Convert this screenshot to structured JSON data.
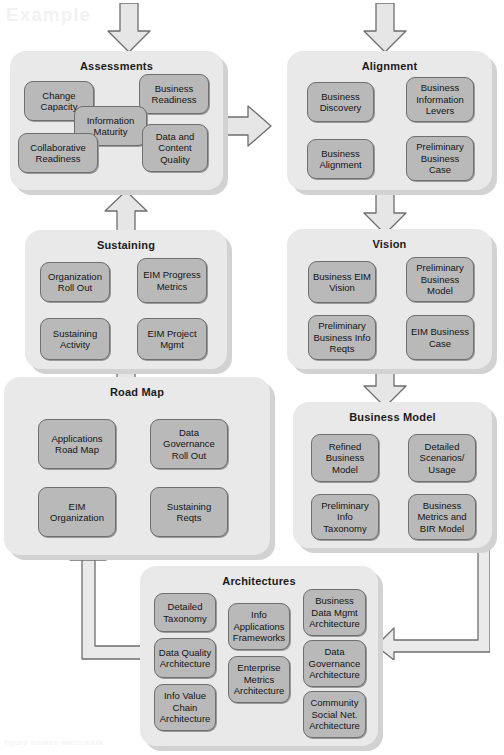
{
  "diagram": {
    "watermark_top": "Example",
    "watermark_bottom": "figure source watermark",
    "colors": {
      "panel_fill": "#e9e9e9",
      "panel_shadow": "#d2d2d2",
      "box_fill": "#b9b9b9",
      "box_border": "#6f6f6f",
      "arrow_fill": "#e4e4e4",
      "arrow_stroke": "#6e6e6e",
      "text": "#141414",
      "page_background": "#ffffff"
    }
  },
  "panels": [
    {
      "id": "assessments",
      "title": "Assessments",
      "boxes": [
        {
          "label": "Change Capacity"
        },
        {
          "label": "Business Readiness"
        },
        {
          "label": "Information Maturity"
        },
        {
          "label": "Collaborative Readiness"
        },
        {
          "label": "Data and Content Quality"
        }
      ]
    },
    {
      "id": "alignment",
      "title": "Alignment",
      "boxes": [
        {
          "label": "Business Discovery"
        },
        {
          "label": "Business Information Levers"
        },
        {
          "label": "Business Alignment"
        },
        {
          "label": "Preliminary Business Case"
        }
      ]
    },
    {
      "id": "sustaining",
      "title": "Sustaining",
      "boxes": [
        {
          "label": "Organization Roll Out"
        },
        {
          "label": "EIM Progress Metrics"
        },
        {
          "label": "Sustaining Activity"
        },
        {
          "label": "EIM Project Mgmt"
        }
      ]
    },
    {
      "id": "vision",
      "title": "Vision",
      "boxes": [
        {
          "label": "Business EIM Vision"
        },
        {
          "label": "Preliminary Business Model"
        },
        {
          "label": "Preliminary Business Info Reqts"
        },
        {
          "label": "EIM Business Case"
        }
      ]
    },
    {
      "id": "roadmap",
      "title": "Road Map",
      "boxes": [
        {
          "label": "Applications Road Map"
        },
        {
          "label": "Data Governance Roll Out"
        },
        {
          "label": "EIM Organization"
        },
        {
          "label": "Sustaining Reqts"
        }
      ]
    },
    {
      "id": "businessmodel",
      "title": "Business Model",
      "boxes": [
        {
          "label": "Refined Business Model"
        },
        {
          "label": "Detailed Scenarios/ Usage"
        },
        {
          "label": "Preliminary Info Taxonomy"
        },
        {
          "label": "Business Metrics and BIR Model"
        }
      ]
    },
    {
      "id": "architectures",
      "title": "Architectures",
      "boxes": [
        {
          "label": "Detailed Taxonomy"
        },
        {
          "label": "Info Applications Frameworks"
        },
        {
          "label": "Business Data Mgmt Architecture"
        },
        {
          "label": "Data Quality Architecture"
        },
        {
          "label": "Enterprise Metrics Architecture"
        },
        {
          "label": "Data Governance Architecture"
        },
        {
          "label": "Info Value Chain Architecture"
        },
        {
          "label": "Community Social Net. Architecture"
        }
      ]
    }
  ],
  "flow": {
    "arrows": [
      {
        "name": "arrow-into-assessments",
        "direction": "down",
        "from": "start",
        "to": "assessments"
      },
      {
        "name": "arrow-into-alignment",
        "direction": "down",
        "from": "start",
        "to": "alignment"
      },
      {
        "name": "arrow-assessments-to-alignment",
        "direction": "right",
        "from": "assessments",
        "to": "alignment"
      },
      {
        "name": "arrow-sustaining-to-assessments",
        "direction": "up",
        "from": "sustaining",
        "to": "assessments"
      },
      {
        "name": "arrow-alignment-to-vision",
        "direction": "down",
        "from": "alignment",
        "to": "vision"
      },
      {
        "name": "arrow-roadmap-to-sustaining",
        "direction": "up",
        "from": "roadmap",
        "to": "sustaining"
      },
      {
        "name": "arrow-vision-to-businessmodel",
        "direction": "down",
        "from": "vision",
        "to": "businessmodel"
      },
      {
        "name": "arrow-architectures-to-roadmap",
        "direction": "elbow-up-left",
        "from": "architectures",
        "to": "roadmap"
      },
      {
        "name": "arrow-businessmodel-to-architectures",
        "direction": "elbow-down-left",
        "from": "businessmodel",
        "to": "architectures"
      }
    ]
  }
}
